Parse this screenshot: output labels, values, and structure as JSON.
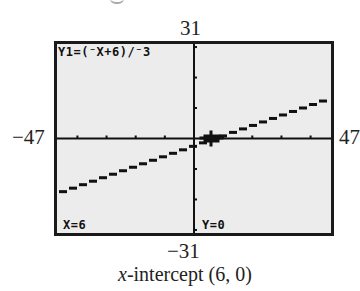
{
  "chart_data": {
    "type": "line",
    "title": "",
    "equation": "Y1=(-X+6)/-3",
    "function": "y = (x - 6) / 3",
    "x": [
      -47,
      47
    ],
    "y": [
      -17.667,
      13.667
    ],
    "xlim": [
      -47,
      47
    ],
    "ylim": [
      -31,
      31
    ],
    "xlabel": "",
    "ylabel": "",
    "x_tick_spacing": 10,
    "y_tick_spacing": 10,
    "grid": false,
    "legend": null,
    "trace_point": {
      "x": 6,
      "y": 0
    },
    "annotations": [
      "x-intercept (6, 0)"
    ]
  },
  "window": {
    "xmin_label": "−47",
    "xmax_label": "47",
    "ymin_label": "−31",
    "ymax_label": "31"
  },
  "screen": {
    "equation_label": "Y1=(⁻X+6)/⁻3",
    "x_readout": "X=6",
    "y_readout": "Y=0",
    "background_color": "#ececec",
    "ink_color": "#111111"
  },
  "caption": {
    "variable": "x",
    "text": "-intercept (6, 0)"
  }
}
